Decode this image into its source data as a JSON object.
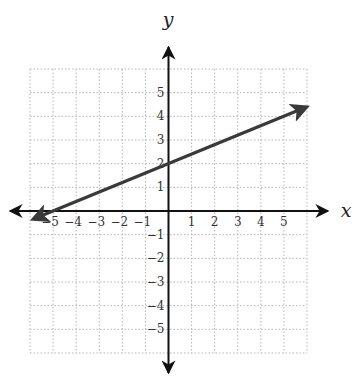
{
  "chart_data": {
    "type": "line",
    "title": "",
    "xlabel": "x",
    "ylabel": "y",
    "xlim": [
      -6,
      6
    ],
    "ylim": [
      -6,
      6
    ],
    "grid": true,
    "grid_style": "dotted",
    "x_ticks": [
      "−5",
      "−4",
      "−3",
      "−2",
      "−1",
      "1",
      "2",
      "3",
      "4",
      "5"
    ],
    "x_tick_values": [
      -5,
      -4,
      -3,
      -2,
      -1,
      1,
      2,
      3,
      4,
      5
    ],
    "y_ticks": [
      "5",
      "4",
      "3",
      "2",
      "1",
      "−1",
      "−2",
      "−3",
      "−4",
      "−5"
    ],
    "y_tick_values": [
      5,
      4,
      3,
      2,
      1,
      -1,
      -2,
      -3,
      -4,
      -5
    ],
    "series": [
      {
        "name": "line",
        "equation": "y = 0.4x + 2",
        "slope": 0.4,
        "intercept": 2,
        "x": [
          -5.85,
          5.97
        ],
        "y": [
          -0.34,
          4.39
        ],
        "arrows": "both",
        "color": "#3a3a3a"
      }
    ],
    "points_of_interest": [
      {
        "label": "y-intercept",
        "x": 0,
        "y": 2
      },
      {
        "label": "x-intercept",
        "x": -5,
        "y": 0
      }
    ],
    "legend": null
  },
  "colors": {
    "axis": "#111111",
    "grid": "#b5b5b5",
    "line": "#3a3a3a"
  }
}
